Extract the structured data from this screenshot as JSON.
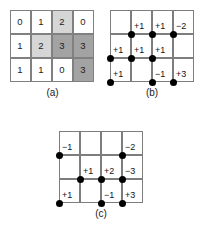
{
  "figure": {
    "background_color": "#ffffff",
    "line_color": "#7d7d7d",
    "dot_color": "#000000",
    "text_color": "#1a1a1a"
  },
  "panels": [
    {
      "id": "a",
      "caption": "(a)",
      "type": "value-grid",
      "columns": 4,
      "rows": 3,
      "legend": {
        "shade_0": "#ffffff",
        "shade_1": "#ffffff",
        "shade_2": "#d6d6d6",
        "shade_3": "#a3a3a3"
      },
      "cells": [
        [
          {
            "value": "0",
            "shade": 0
          },
          {
            "value": "1",
            "shade": 1
          },
          {
            "value": "2",
            "shade": 2
          },
          {
            "value": "0",
            "shade": 0
          }
        ],
        [
          {
            "value": "1",
            "shade": 1
          },
          {
            "value": "2",
            "shade": 2
          },
          {
            "value": "3",
            "shade": 3
          },
          {
            "value": "3",
            "shade": 3
          }
        ],
        [
          {
            "value": "1",
            "shade": 1
          },
          {
            "value": "1",
            "shade": 1
          },
          {
            "value": "0",
            "shade": 0
          },
          {
            "value": "3",
            "shade": 3
          }
        ]
      ]
    },
    {
      "id": "b",
      "caption": "(b)",
      "type": "lattice",
      "columns": 4,
      "rows": 3,
      "nodes": [
        {
          "col": 1,
          "row": 1,
          "label": "+1",
          "label_side": "right"
        },
        {
          "col": 2,
          "row": 1,
          "label": "+1",
          "label_side": "right"
        },
        {
          "col": 3,
          "row": 1,
          "label": "−2",
          "label_side": "right"
        },
        {
          "col": 0,
          "row": 2,
          "label": "+1",
          "label_side": "right"
        },
        {
          "col": 1,
          "row": 2,
          "label": "+1",
          "label_side": "right"
        },
        {
          "col": 2,
          "row": 2,
          "label": "+1",
          "label_side": "right"
        },
        {
          "col": 0,
          "row": 3,
          "label": "+1",
          "label_side": "right"
        },
        {
          "col": 2,
          "row": 3,
          "label": "−1",
          "label_side": "right"
        },
        {
          "col": 3,
          "row": 3,
          "label": "+3",
          "label_side": "right"
        }
      ]
    },
    {
      "id": "c",
      "caption": "(c)",
      "type": "lattice",
      "columns": 4,
      "rows": 3,
      "nodes": [
        {
          "col": 0,
          "row": 1,
          "label": "−1",
          "label_side": "right"
        },
        {
          "col": 3,
          "row": 1,
          "label": "−2",
          "label_side": "right"
        },
        {
          "col": 1,
          "row": 2,
          "label": "+1",
          "label_side": "right"
        },
        {
          "col": 2,
          "row": 2,
          "label": "+2",
          "label_side": "right"
        },
        {
          "col": 3,
          "row": 2,
          "label": "−3",
          "label_side": "right"
        },
        {
          "col": 0,
          "row": 3,
          "label": "+1",
          "label_side": "right"
        },
        {
          "col": 2,
          "row": 3,
          "label": "−1",
          "label_side": "right"
        },
        {
          "col": 3,
          "row": 3,
          "label": "+3",
          "label_side": "right"
        }
      ]
    }
  ]
}
